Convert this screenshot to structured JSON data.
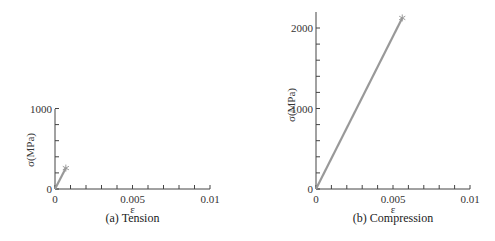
{
  "chart_data": [
    {
      "type": "line",
      "title": "(a) Tension",
      "xlabel": "ε",
      "ylabel": "σ(MPa)",
      "xlim": [
        0,
        0.01
      ],
      "ylim": [
        0,
        1000
      ],
      "xticks": [
        0,
        0.005,
        0.01
      ],
      "xtick_labels": [
        "0",
        "0.005",
        "0.01"
      ],
      "x_minor_tick_step": 0.001,
      "yticks": [
        0,
        1000
      ],
      "ytick_labels": [
        "0",
        "1000"
      ],
      "y_minor_tick_step": 200,
      "grid": false,
      "series": [
        {
          "name": "stress-strain",
          "x": [
            0,
            0.0007
          ],
          "y": [
            0,
            260
          ],
          "color": "#999999",
          "end_marker": "asterisk"
        }
      ]
    },
    {
      "type": "line",
      "title": "(b) Compression",
      "xlabel": "ε",
      "ylabel": "σ(MPa)",
      "xlim": [
        0,
        0.01
      ],
      "ylim": [
        0,
        2200
      ],
      "xticks": [
        0,
        0.005,
        0.01
      ],
      "xtick_labels": [
        "0",
        "0.005",
        "0.01"
      ],
      "x_minor_tick_step": 0.001,
      "yticks": [
        0,
        1000,
        2000
      ],
      "ytick_labels": [
        "0",
        "1000",
        "2000"
      ],
      "y_minor_tick_step": 200,
      "grid": false,
      "series": [
        {
          "name": "stress-strain",
          "x": [
            0,
            0.0056
          ],
          "y": [
            0,
            2125
          ],
          "color": "#999999",
          "end_marker": "asterisk"
        }
      ]
    }
  ]
}
